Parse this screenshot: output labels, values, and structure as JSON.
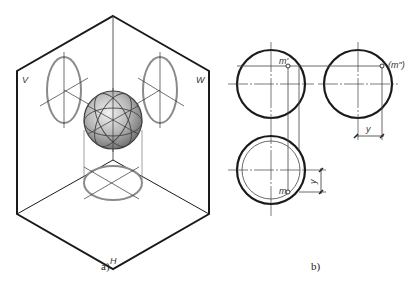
{
  "figure_a": {
    "caption": "a)",
    "plane_labels": {
      "v": "V",
      "w": "W",
      "h": "H"
    },
    "colors": {
      "frame": "#1a1a1a",
      "ellipse": "#8a8a8a",
      "axis": "#333333"
    }
  },
  "figure_b": {
    "caption": "b)",
    "labels": {
      "front_point": "m'",
      "profile_point": "(m\")",
      "top_point": "m",
      "dim_y_right": "y",
      "dim_y_bottom": "y"
    },
    "colors": {
      "outline": "#1a1a1a",
      "thin": "#444444"
    }
  }
}
